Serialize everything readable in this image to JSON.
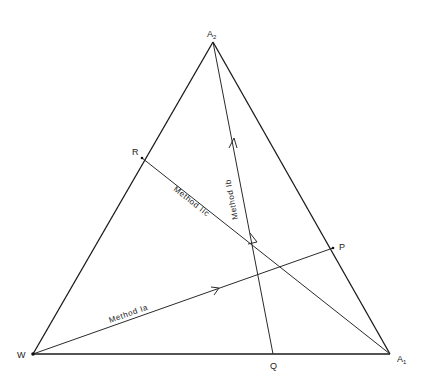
{
  "diagram": {
    "type": "ternary triangle",
    "vertices": {
      "top": {
        "label": "A",
        "sub": "2",
        "x": 213,
        "y": 42
      },
      "left": {
        "label": "W",
        "x": 33,
        "y": 354
      },
      "right": {
        "label": "A",
        "sub": "1",
        "x": 390,
        "y": 354
      }
    },
    "points": {
      "R": {
        "label": "R",
        "x": 142,
        "y": 158
      },
      "P": {
        "label": "P",
        "x": 333,
        "y": 248
      },
      "Q": {
        "label": "Q",
        "x": 273,
        "y": 354
      }
    },
    "paths": [
      {
        "name": "Method Ia",
        "label": "Method  Ia",
        "from": "W",
        "to": "P"
      },
      {
        "name": "Method Ib",
        "label": "Method  Ib",
        "from": "Q",
        "to": "A2"
      },
      {
        "name": "Method IIc",
        "label": "Method  IIc",
        "from": "R",
        "to": "A1"
      }
    ]
  }
}
